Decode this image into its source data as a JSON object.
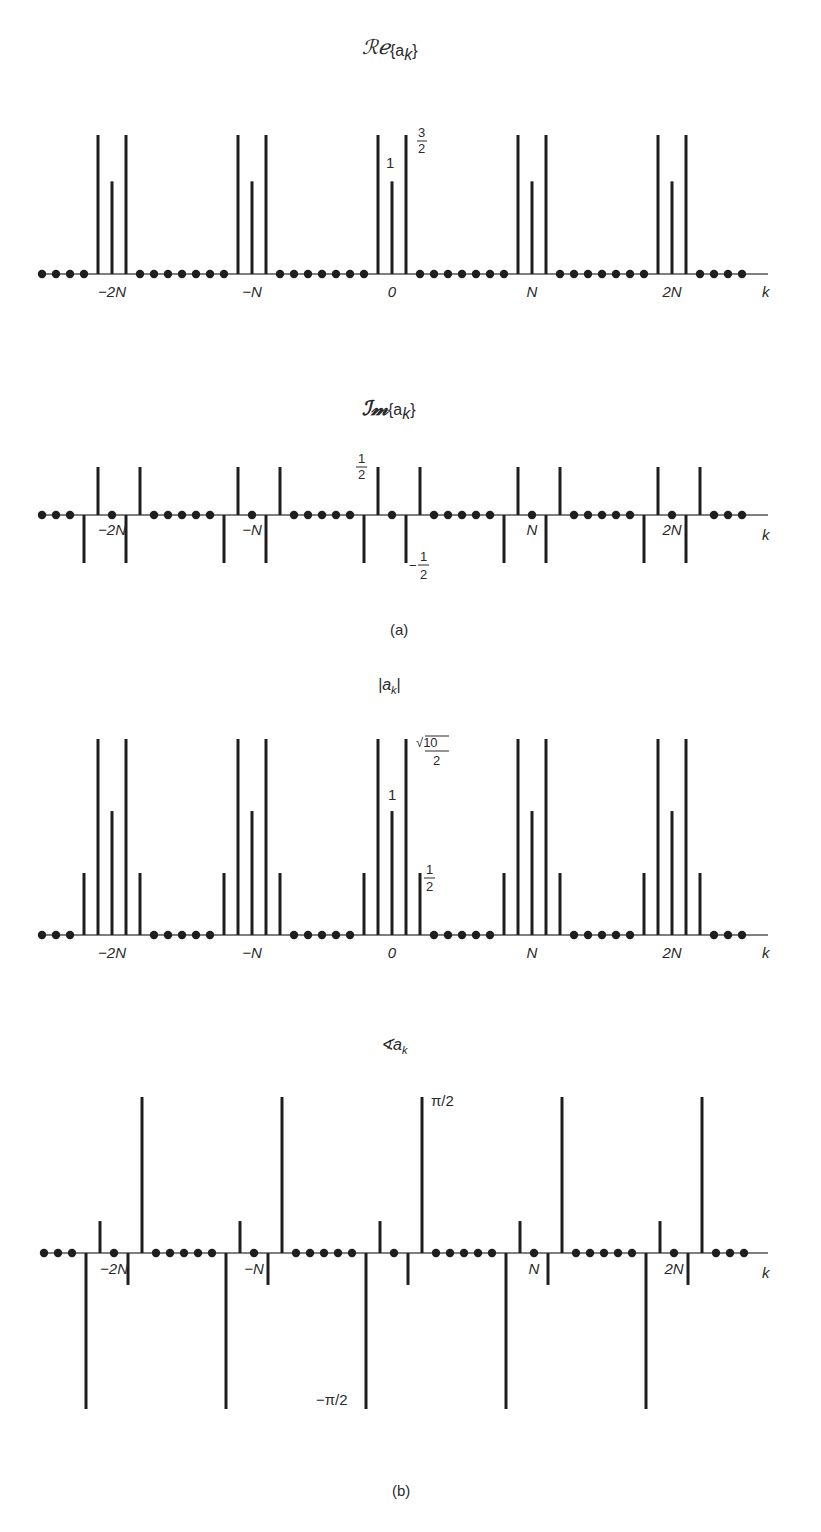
{
  "chart_data": [
    {
      "type": "stem",
      "title": "Re{a_k}",
      "title_display": {
        "prefix": "ℜℯ",
        "arg": "{a",
        "sub": "k",
        "close": "}"
      },
      "xlabel": "k",
      "period_N": 10,
      "k_range": [
        -25,
        25
      ],
      "period_values": {
        "-2": 0,
        "-1": 1.5,
        "0": 1,
        "1": 1.5,
        "2": 0
      },
      "ylim": [
        0,
        1.5
      ],
      "xtick_labels": [
        {
          "k": -20,
          "label": "−2N"
        },
        {
          "k": -10,
          "label": "−N"
        },
        {
          "k": 0,
          "label": "0"
        },
        {
          "k": 10,
          "label": "N"
        },
        {
          "k": 20,
          "label": "2N"
        }
      ],
      "annotations": [
        {
          "text": "1",
          "value": 1
        },
        {
          "text": "3/2",
          "value": 1.5
        }
      ]
    },
    {
      "type": "stem",
      "title": "Im{a_k}",
      "title_display": {
        "prefix": "ℑ𝔪",
        "arg": "{a",
        "sub": "k",
        "close": "}"
      },
      "xlabel": "k",
      "period_N": 10,
      "k_range": [
        -25,
        25
      ],
      "period_values": {
        "-2": -0.5,
        "-1": 0.5,
        "0": 0,
        "1": -0.5,
        "2": 0.5
      },
      "ylim": [
        -0.5,
        0.5
      ],
      "xtick_labels": [
        {
          "k": -20,
          "label": "−2N"
        },
        {
          "k": -10,
          "label": "−N"
        },
        {
          "k": 10,
          "label": "N"
        },
        {
          "k": 20,
          "label": "2N"
        }
      ],
      "annotations": [
        {
          "text": "1/2",
          "value": 0.5
        },
        {
          "text": "−1/2",
          "value": -0.5
        }
      ],
      "caption": "(a)"
    },
    {
      "type": "stem",
      "title": "|a_k|",
      "xlabel": "k",
      "period_N": 10,
      "k_range": [
        -25,
        25
      ],
      "period_values": {
        "-2": 0.5,
        "-1": 1.5811,
        "0": 1,
        "1": 1.5811,
        "2": 0.5
      },
      "ylim": [
        0,
        1.5811
      ],
      "xtick_labels": [
        {
          "k": -20,
          "label": "−2N"
        },
        {
          "k": -10,
          "label": "−N"
        },
        {
          "k": 0,
          "label": "0"
        },
        {
          "k": 10,
          "label": "N"
        },
        {
          "k": 20,
          "label": "2N"
        }
      ],
      "annotations": [
        {
          "text": "√10/2",
          "value": 1.5811
        },
        {
          "text": "1",
          "value": 1
        },
        {
          "text": "1/2",
          "value": 0.5
        }
      ]
    },
    {
      "type": "stem",
      "title": "∢a_k",
      "xlabel": "k",
      "period_N": 10,
      "k_range": [
        -25,
        25
      ],
      "period_values": {
        "-2": -1.5708,
        "-1": 0.3218,
        "0": 0,
        "1": -0.3218,
        "2": 1.5708
      },
      "ylim": [
        -1.5708,
        1.5708
      ],
      "xtick_labels": [
        {
          "k": -20,
          "label": "−2N"
        },
        {
          "k": -10,
          "label": "−N"
        },
        {
          "k": 10,
          "label": "N"
        },
        {
          "k": 20,
          "label": "2N"
        }
      ],
      "annotations": [
        {
          "text": "π/2",
          "value": 1.5708
        },
        {
          "text": "−π/2",
          "value": -1.5708
        }
      ],
      "caption": "(b)"
    }
  ],
  "labels": {
    "re_title_script": "ℛℯ",
    "im_title_script": "ℐ𝓂",
    "abs_title": "|a",
    "angle_title": "∢a",
    "sub_k": "k",
    "set_open": "{a",
    "set_close": "}",
    "k": "k",
    "zero": "0",
    "one": "1",
    "three": "3",
    "two": "2",
    "half_num": "1",
    "half_den": "2",
    "minus": "−",
    "sqrt10": "√10",
    "pi_half": "π/2",
    "neg_pi_half": "−π/2",
    "caption_a": "(a)",
    "caption_b": "(b)"
  }
}
